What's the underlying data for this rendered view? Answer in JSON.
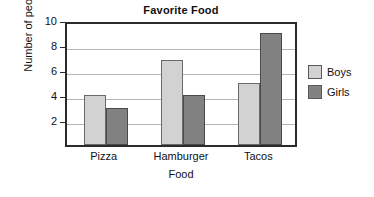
{
  "chart_data": {
    "type": "bar",
    "title": "Favorite Food",
    "xlabel": "Food",
    "ylabel": "Number of people",
    "categories": [
      "Pizza",
      "Hamburger",
      "Tacos"
    ],
    "series": [
      {
        "name": "Boys",
        "color": "#d2d2d2",
        "values": [
          4,
          6.8,
          5
        ]
      },
      {
        "name": "Girls",
        "color": "#828282",
        "values": [
          3,
          4,
          9
        ]
      }
    ],
    "ylim": [
      0,
      10
    ],
    "yticks": [
      2,
      4,
      6,
      8,
      10
    ],
    "ytick_labels": [
      "2",
      "4",
      "6",
      "8",
      "10"
    ],
    "grid": true,
    "legend_position": "right"
  }
}
